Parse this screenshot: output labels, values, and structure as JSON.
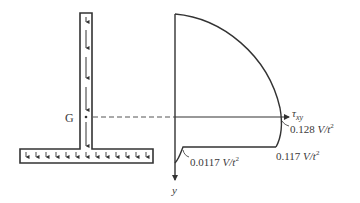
{
  "diagram": {
    "section": {
      "centroid_label": "G",
      "web_arrow_count": 5,
      "flange_arrow_count": 14
    },
    "plot": {
      "x_axis_label": "τ",
      "x_axis_subscript": "xy",
      "y_axis_label": "y",
      "labels": {
        "max_value": "0.128",
        "junction_web_value": "0.117",
        "junction_flange_value": "0.0117",
        "unit_prefix": "V/t",
        "unit_exp": "2"
      }
    },
    "colors": {
      "stroke": "#333333",
      "text": "#3a3a3a",
      "background": "#ffffff"
    }
  }
}
